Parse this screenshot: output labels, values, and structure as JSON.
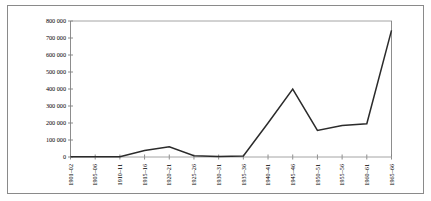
{
  "chart_data": {
    "type": "line",
    "title": "",
    "subtitle": "",
    "xlabel": "",
    "ylabel": "",
    "grid": false,
    "legend": "none",
    "categories": [
      "1901–02",
      "1905–06",
      "1910–11",
      "1915–16",
      "1920–21",
      "1925–26",
      "1930–31",
      "1935–36",
      "1940–41",
      "1945–46",
      "1950–51",
      "1955–56",
      "1960–61",
      "1965–66"
    ],
    "values": [
      1000,
      1000,
      2000,
      38000,
      60000,
      7000,
      3000,
      6000,
      200000,
      400000,
      156000,
      185000,
      196000,
      745000
    ],
    "series": [
      {
        "name": "",
        "values": [
          1000,
          1000,
          2000,
          38000,
          60000,
          7000,
          3000,
          6000,
          200000,
          400000,
          156000,
          185000,
          196000,
          745000
        ]
      }
    ],
    "ylim": [
      0,
      800000
    ],
    "ytick_values": [
      0,
      100000,
      200000,
      300000,
      400000,
      500000,
      600000,
      700000,
      800000
    ],
    "ytick_labels": [
      "0",
      "100 000",
      "200 000",
      "300 000",
      "400 000",
      "500 000",
      "600 000",
      "700 000",
      "800 000"
    ],
    "line_color": "#2b2b2b",
    "axis_color": "#808080",
    "background_color": "#ffffff",
    "frame_color": "#8a8a8a"
  }
}
